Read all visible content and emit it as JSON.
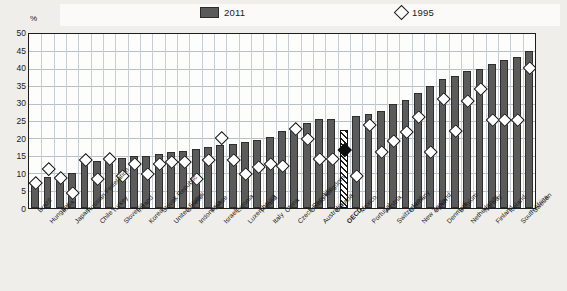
{
  "axis": {
    "y_unit": "%",
    "y_ticks": [
      50,
      45,
      40,
      35,
      30,
      25,
      20,
      15,
      10,
      5,
      0
    ]
  },
  "legend": [
    {
      "label": "2011",
      "marker": "bar-swatch",
      "color": "#5a5a5a"
    },
    {
      "label": "1995",
      "marker": "diamond-outline",
      "color": "#1d1d1d"
    }
  ],
  "chart_data": {
    "type": "bar",
    "title": "",
    "subtitle": "",
    "xlabel": "",
    "ylabel": "%",
    "ylim": [
      0,
      50
    ],
    "grid": true,
    "legend_position": "top",
    "categories": [
      "Brazil",
      "Hungary",
      "India",
      "Japan",
      "Russian Federation",
      "Chile",
      "Turkey",
      "Slovenia",
      "Ireland",
      "Korea",
      "Slovak Republic",
      "United States",
      "Greece",
      "Indonesia",
      "France",
      "Israel*",
      "Estonia",
      "Luxembourg",
      "Poland",
      "Italy",
      "China",
      "Czech Republic",
      "United Kingdom",
      "Australia",
      "Canada",
      "OECD",
      "Mexico",
      "Portugal",
      "Austria",
      "Switzerland",
      "Germany",
      "New Zealand",
      "Spain",
      "Denmark",
      "Belgium",
      "Netherlands",
      "Norway",
      "Finland",
      "Iceland",
      "South Africa",
      "Sweden"
    ],
    "series": [
      {
        "name": "2011",
        "marker": "bar",
        "values": [
          7.0,
          9.0,
          9.5,
          10.0,
          13.5,
          13.5,
          14.0,
          14.5,
          15.0,
          15.0,
          15.5,
          16.0,
          16.5,
          17.0,
          17.5,
          18.0,
          18.5,
          19.0,
          19.5,
          20.5,
          22.0,
          23.0,
          24.5,
          25.5,
          25.5,
          22.5,
          26.5,
          27.0,
          28.0,
          30.0,
          31.0,
          33.0,
          35.0,
          37.0,
          38.0,
          39.5,
          40.0,
          41.5,
          42.5,
          43.5,
          45.0
        ]
      },
      {
        "name": "1995",
        "marker": "diamond",
        "values": [
          7.0,
          11.0,
          8.5,
          4.0,
          13.5,
          8.0,
          14.0,
          9.0,
          12.5,
          9.5,
          12.5,
          13.0,
          13.0,
          8.0,
          13.5,
          20.0,
          13.5,
          9.5,
          11.5,
          12.5,
          12.0,
          22.5,
          19.5,
          14.0,
          14.0,
          16.5,
          9.0,
          23.5,
          16.0,
          19.0,
          21.5,
          26.0,
          16.0,
          31.0,
          22.0,
          30.5,
          34.0,
          25.0,
          25.0,
          25.0,
          40.0
        ]
      }
    ],
    "highlight_category": "OECD",
    "highlight_style": "hatched-bar-with-filled-diamond"
  }
}
